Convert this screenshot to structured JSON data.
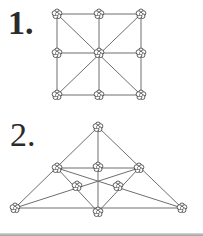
{
  "figures": [
    {
      "label": "1.",
      "shape": "square-grid",
      "nodes": [
        [
          57,
          14
        ],
        [
          99,
          14
        ],
        [
          141,
          14
        ],
        [
          57,
          53
        ],
        [
          99,
          53
        ],
        [
          141,
          53
        ],
        [
          57,
          95
        ],
        [
          99,
          95
        ],
        [
          141,
          95
        ]
      ],
      "edges": [
        [
          0,
          2
        ],
        [
          3,
          5
        ],
        [
          6,
          8
        ],
        [
          0,
          6
        ],
        [
          1,
          7
        ],
        [
          2,
          8
        ],
        [
          0,
          8
        ],
        [
          2,
          6
        ]
      ]
    },
    {
      "label": "2.",
      "shape": "triangle",
      "nodes": [
        [
          98,
          127
        ],
        [
          57,
          168
        ],
        [
          98,
          167
        ],
        [
          139,
          168
        ],
        [
          77,
          186
        ],
        [
          118,
          186
        ],
        [
          15,
          208
        ],
        [
          98,
          212
        ],
        [
          182,
          208
        ]
      ],
      "edges": [
        [
          0,
          6
        ],
        [
          0,
          8
        ],
        [
          0,
          7
        ],
        [
          6,
          8
        ],
        [
          1,
          3
        ],
        [
          1,
          7
        ],
        [
          3,
          7
        ],
        [
          1,
          8
        ],
        [
          3,
          6
        ]
      ]
    }
  ],
  "colors": {
    "line": "#6e6e6e",
    "node_fill": "#ffffff",
    "node_stroke": "#3a3a3a",
    "text": "#2b2b2b"
  },
  "node_icon": "flower-icon"
}
